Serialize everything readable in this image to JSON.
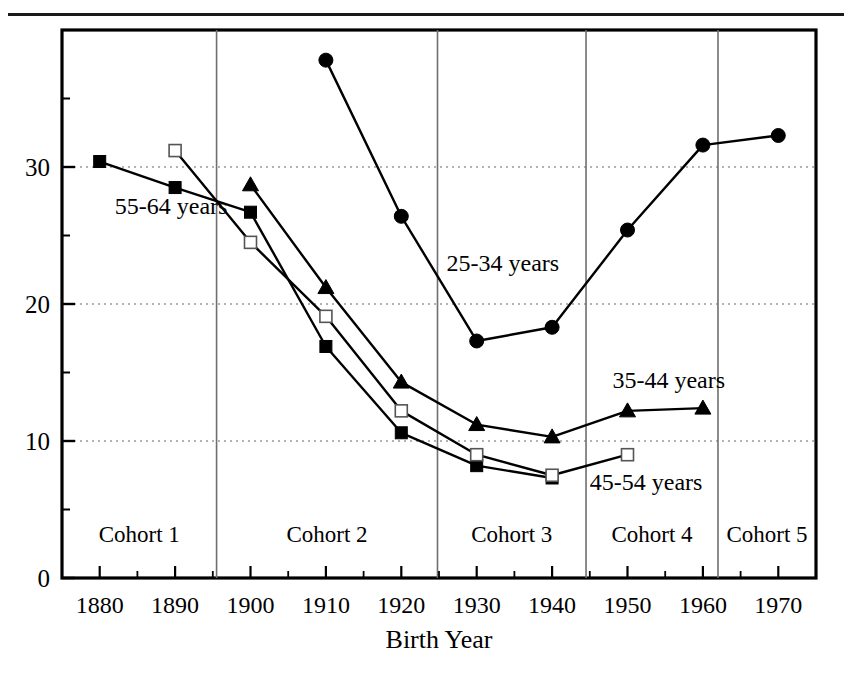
{
  "figure": {
    "top_rule": true,
    "partial_caption": ""
  },
  "chart_data": {
    "type": "line",
    "title": "",
    "xlabel": "Birth Year",
    "ylabel": "",
    "xlim": [
      1875,
      1975
    ],
    "ylim": [
      0,
      40
    ],
    "x": [
      1880,
      1890,
      1900,
      1910,
      1920,
      1930,
      1940,
      1950,
      1960,
      1970
    ],
    "x_tick_labels": [
      "1880",
      "1890",
      "1900",
      "1910",
      "1920",
      "1930",
      "1940",
      "1950",
      "1960",
      "1970"
    ],
    "y_tick_labels": [
      "0",
      "10",
      "20",
      "30"
    ],
    "y_ticks": [
      0,
      10,
      20,
      30
    ],
    "y_minor_ticks": [
      5,
      15,
      25,
      35
    ],
    "grid": "horizontal-dotted",
    "legend": "inline-annotations",
    "series": [
      {
        "name": "55-64 years",
        "marker": "filled-square",
        "x": [
          1880,
          1890,
          1900,
          1910,
          1920,
          1930,
          1940
        ],
        "values": [
          30.4,
          28.5,
          26.7,
          16.9,
          10.6,
          8.2,
          7.3
        ]
      },
      {
        "name": "45-54 years",
        "marker": "open-square",
        "x": [
          1890,
          1900,
          1910,
          1920,
          1930,
          1940,
          1950
        ],
        "values": [
          31.2,
          24.5,
          19.1,
          12.2,
          9.0,
          7.5,
          9.0
        ]
      },
      {
        "name": "35-44 years",
        "marker": "filled-triangle",
        "x": [
          1900,
          1910,
          1920,
          1930,
          1940,
          1950,
          1960
        ],
        "values": [
          28.7,
          21.2,
          14.3,
          11.2,
          10.3,
          12.2,
          12.4
        ]
      },
      {
        "name": "25-34 years",
        "marker": "filled-circle",
        "x": [
          1910,
          1920,
          1930,
          1940,
          1950,
          1960,
          1970
        ],
        "values": [
          37.8,
          26.4,
          17.3,
          18.3,
          25.4,
          31.6,
          32.3
        ]
      }
    ],
    "annotations": [
      {
        "text": "55-64 years",
        "x": 1882,
        "y": 26.6
      },
      {
        "text": "25-34 years",
        "x": 1926,
        "y": 22.4
      },
      {
        "text": "35-44 years",
        "x": 1948,
        "y": 13.9
      },
      {
        "text": "45-54 years",
        "x": 1945,
        "y": 6.4
      }
    ],
    "cohort_bands": [
      {
        "label": "Cohort 1",
        "start": 1875,
        "end": 1895.5
      },
      {
        "label": "Cohort 2",
        "start": 1895.5,
        "end": 1924.8
      },
      {
        "label": "Cohort 3",
        "start": 1924.8,
        "end": 1944.5
      },
      {
        "label": "Cohort 4",
        "start": 1944.5,
        "end": 1962.0
      },
      {
        "label": "Cohort 5",
        "start": 1962.0,
        "end": 1975
      }
    ],
    "cohort_label_y": 2.6,
    "colors": {
      "line": "#000000",
      "grid": "#9a9a9a",
      "frame": "#000000",
      "marker_fill": "#000000",
      "open_marker_fill": "#ffffff"
    }
  }
}
